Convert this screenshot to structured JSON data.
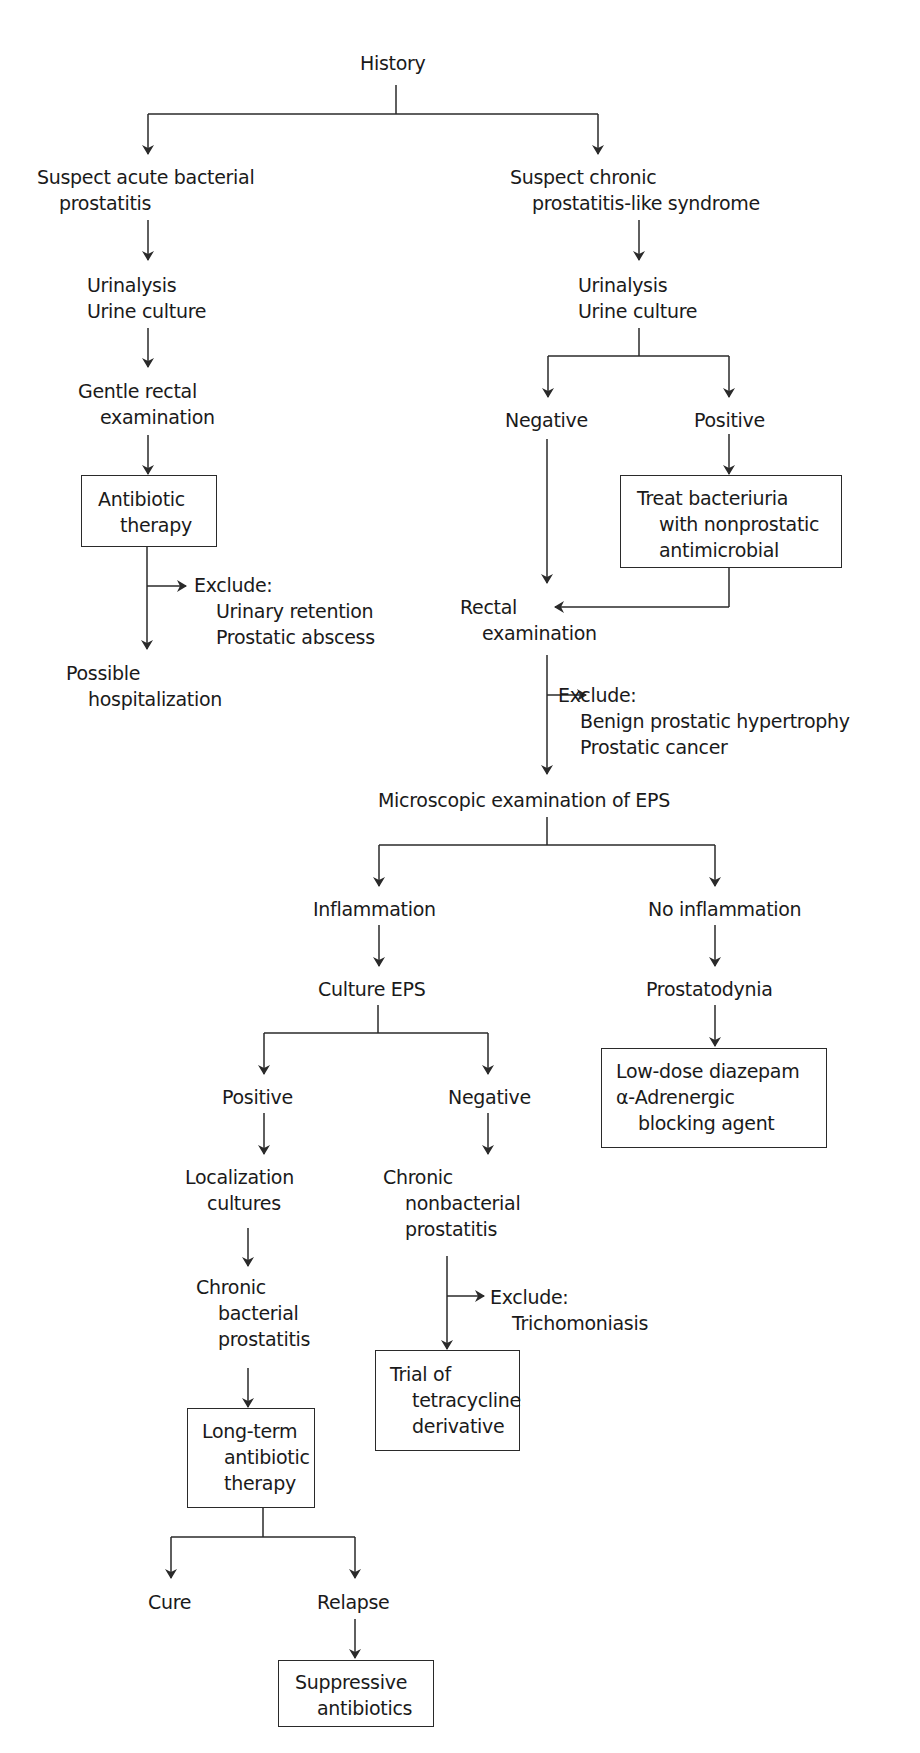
{
  "nodes": {
    "history": [
      "History"
    ],
    "acute": [
      "Suspect acute bacterial",
      "prostatitis"
    ],
    "acute_ua": [
      "Urinalysis",
      "Urine culture"
    ],
    "gentle_rectal": [
      "Gentle rectal",
      "examination"
    ],
    "antibiotic_therapy": [
      "Antibiotic",
      "therapy"
    ],
    "acute_exclude": [
      "Exclude:",
      "Urinary retention",
      "Prostatic abscess"
    ],
    "hospitalization": [
      "Possible",
      "hospitalization"
    ],
    "chronic": [
      "Suspect chronic",
      "prostatitis-like syndrome"
    ],
    "chronic_ua": [
      "Urinalysis",
      "Urine culture"
    ],
    "ua_negative": [
      "Negative"
    ],
    "ua_positive": [
      "Positive"
    ],
    "treat_bacteriuria": [
      "Treat bacteriuria",
      "with nonprostatic",
      "antimicrobial"
    ],
    "rectal_exam": [
      "Rectal",
      "examination"
    ],
    "rectal_exclude": [
      "Exclude:",
      "Benign prostatic hypertrophy",
      "Prostatic cancer"
    ],
    "eps_micro": [
      "Microscopic examination of EPS"
    ],
    "inflammation": [
      "Inflammation"
    ],
    "no_inflammation": [
      "No inflammation"
    ],
    "culture_eps": [
      "Culture EPS"
    ],
    "prostatodynia": [
      "Prostatodynia"
    ],
    "diazepam": [
      "Low-dose diazepam",
      "α-Adrenergic",
      "blocking agent"
    ],
    "culture_positive": [
      "Positive"
    ],
    "culture_negative": [
      "Negative"
    ],
    "localization": [
      "Localization",
      "cultures"
    ],
    "chronic_nonbacterial": [
      "Chronic",
      "nonbacterial",
      "prostatitis"
    ],
    "nonbacterial_exclude": [
      "Exclude:",
      "Trichomoniasis"
    ],
    "chronic_bacterial": [
      "Chronic",
      "bacterial",
      "prostatitis"
    ],
    "tetracycline": [
      "Trial of",
      "tetracycline",
      "derivative"
    ],
    "longterm": [
      "Long-term",
      "antibiotic",
      "therapy"
    ],
    "cure": [
      "Cure"
    ],
    "relapse": [
      "Relapse"
    ],
    "suppressive": [
      "Suppressive",
      "antibiotics"
    ]
  },
  "colors": {
    "line": "#2a2a2a",
    "text": "#1a1a1a",
    "background": "#ffffff"
  }
}
